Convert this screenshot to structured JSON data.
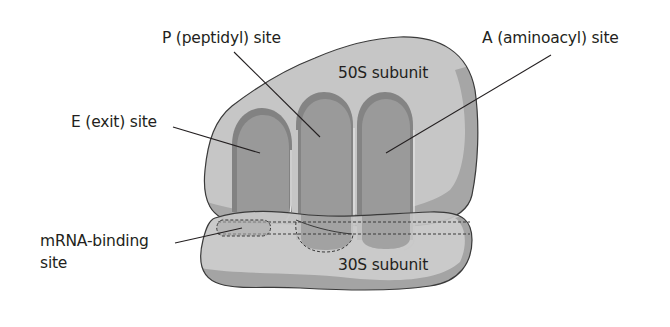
{
  "diagram": {
    "colors": {
      "background": "#ffffff",
      "subunit_light": "#c6c6c6",
      "subunit_shadow": "#a4a4a4",
      "site_fill": "#999999",
      "site_rim": "#828282",
      "outline": "#3a3a3a",
      "text": "#231f20"
    },
    "labels": {
      "p_site": "P (peptidyl) site",
      "a_site": "A (aminoacyl) site",
      "e_site": "E (exit) site",
      "large_subunit": "50S subunit",
      "small_subunit": "30S subunit",
      "mrna_line1": "mRNA-binding",
      "mrna_line2": "site"
    }
  }
}
